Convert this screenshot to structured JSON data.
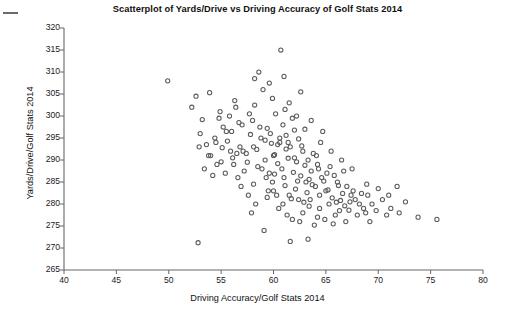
{
  "chart_data": {
    "type": "scatter",
    "title": "Scatterplot of Yards/Drive vs Driving Accuracy of Golf Stats 2014",
    "xlabel": "Driving Accuracy/Golf Stats 2014",
    "ylabel": "Yards/Drive/Golf Stats 2014",
    "xlim": [
      40,
      80
    ],
    "ylim": [
      265,
      320
    ],
    "xticks": [
      40,
      45,
      50,
      55,
      60,
      65,
      70,
      75,
      80
    ],
    "yticks": [
      265,
      270,
      275,
      280,
      285,
      290,
      295,
      300,
      305,
      310,
      315,
      320
    ],
    "grid": false,
    "legend": null,
    "marker": {
      "shape": "open-circle",
      "color": "#5c5c5c",
      "size_px": 4.2,
      "fill": "none"
    },
    "n_points": 191,
    "correlation_description": "negative",
    "series": [
      {
        "name": "PGA Tour players 2014",
        "points": [
          [
            49.9,
            308.0
          ],
          [
            52.6,
            304.5
          ],
          [
            53.9,
            305.3
          ],
          [
            54.9,
            301.0
          ],
          [
            55.8,
            300.0
          ],
          [
            53.2,
            299.2
          ],
          [
            56.4,
            302.0
          ],
          [
            57.0,
            298.0
          ],
          [
            55.2,
            297.5
          ],
          [
            56.0,
            296.5
          ],
          [
            54.4,
            295.0
          ],
          [
            55.6,
            294.3
          ],
          [
            53.6,
            293.5
          ],
          [
            56.8,
            293.0
          ],
          [
            54.0,
            291.0
          ],
          [
            55.0,
            289.6
          ],
          [
            56.2,
            289.0
          ],
          [
            57.4,
            291.5
          ],
          [
            52.8,
            271.2
          ],
          [
            57.8,
            295.8
          ],
          [
            58.2,
            302.5
          ],
          [
            58.6,
            310.0
          ],
          [
            59.0,
            306.0
          ],
          [
            58.0,
            299.0
          ],
          [
            59.4,
            297.2
          ],
          [
            58.8,
            295.0
          ],
          [
            59.8,
            293.8
          ],
          [
            58.4,
            292.4
          ],
          [
            60.0,
            291.0
          ],
          [
            59.2,
            290.0
          ],
          [
            60.4,
            289.2
          ],
          [
            58.9,
            288.0
          ],
          [
            59.6,
            287.0
          ],
          [
            60.7,
            315.0
          ],
          [
            61.0,
            309.0
          ],
          [
            61.5,
            303.0
          ],
          [
            60.2,
            300.5
          ],
          [
            61.8,
            299.5
          ],
          [
            60.9,
            298.0
          ],
          [
            62.0,
            296.8
          ],
          [
            61.2,
            295.6
          ],
          [
            62.4,
            294.8
          ],
          [
            60.6,
            294.0
          ],
          [
            61.6,
            293.0
          ],
          [
            62.8,
            292.0
          ],
          [
            60.1,
            291.2
          ],
          [
            61.4,
            290.4
          ],
          [
            62.2,
            289.6
          ],
          [
            63.0,
            288.8
          ],
          [
            60.8,
            288.0
          ],
          [
            61.9,
            287.2
          ],
          [
            62.6,
            286.4
          ],
          [
            63.4,
            285.6
          ],
          [
            59.9,
            285.0
          ],
          [
            61.1,
            284.2
          ],
          [
            62.1,
            283.4
          ],
          [
            63.2,
            282.6
          ],
          [
            60.3,
            282.0
          ],
          [
            61.7,
            281.2
          ],
          [
            62.9,
            280.4
          ],
          [
            63.8,
            291.5
          ],
          [
            64.2,
            289.0
          ],
          [
            63.6,
            287.5
          ],
          [
            64.6,
            286.0
          ],
          [
            63.1,
            285.0
          ],
          [
            64.0,
            284.0
          ],
          [
            65.0,
            283.0
          ],
          [
            64.4,
            282.0
          ],
          [
            63.5,
            281.0
          ],
          [
            65.4,
            288.5
          ],
          [
            65.8,
            286.5
          ],
          [
            64.8,
            285.2
          ],
          [
            66.2,
            284.2
          ],
          [
            65.2,
            283.2
          ],
          [
            66.6,
            282.4
          ],
          [
            65.6,
            281.4
          ],
          [
            66.0,
            280.4
          ],
          [
            67.0,
            284.0
          ],
          [
            67.4,
            282.0
          ],
          [
            66.4,
            280.8
          ],
          [
            67.8,
            281.0
          ],
          [
            66.8,
            279.6
          ],
          [
            68.2,
            280.0
          ],
          [
            67.2,
            278.6
          ],
          [
            68.6,
            279.0
          ],
          [
            69.0,
            282.0
          ],
          [
            69.4,
            280.0
          ],
          [
            68.8,
            278.0
          ],
          [
            70.0,
            283.5
          ],
          [
            70.4,
            281.0
          ],
          [
            71.2,
            279.0
          ],
          [
            71.8,
            284.0
          ],
          [
            72.6,
            280.5
          ],
          [
            73.8,
            277.0
          ],
          [
            75.6,
            276.5
          ],
          [
            57.2,
            287.5
          ],
          [
            58.1,
            284.5
          ],
          [
            59.5,
            283.0
          ],
          [
            60.5,
            279.0
          ],
          [
            61.3,
            277.5
          ],
          [
            62.5,
            276.0
          ],
          [
            63.9,
            275.2
          ],
          [
            64.9,
            276.5
          ],
          [
            65.9,
            277.5
          ],
          [
            66.9,
            276.0
          ],
          [
            57.6,
            282.0
          ],
          [
            58.3,
            280.0
          ],
          [
            56.6,
            286.0
          ],
          [
            55.4,
            287.0
          ],
          [
            54.6,
            289.0
          ],
          [
            53.4,
            288.0
          ],
          [
            56.9,
            284.0
          ],
          [
            57.9,
            278.0
          ],
          [
            59.1,
            274.0
          ],
          [
            61.6,
            271.5
          ],
          [
            63.3,
            272.0
          ],
          [
            55.9,
            292.0
          ],
          [
            54.2,
            286.5
          ],
          [
            52.2,
            302.0
          ],
          [
            53.0,
            296.0
          ],
          [
            54.8,
            299.5
          ],
          [
            56.5,
            291.5
          ],
          [
            57.5,
            289.5
          ],
          [
            58.5,
            288.5
          ],
          [
            59.3,
            286.0
          ],
          [
            60.1,
            286.8
          ],
          [
            61.0,
            286.0
          ],
          [
            62.3,
            285.2
          ],
          [
            63.7,
            284.4
          ],
          [
            64.3,
            288.0
          ],
          [
            65.1,
            287.0
          ],
          [
            66.1,
            285.0
          ],
          [
            67.6,
            283.0
          ],
          [
            68.4,
            282.4
          ],
          [
            69.8,
            278.5
          ],
          [
            58.7,
            297.5
          ],
          [
            59.7,
            296.0
          ],
          [
            60.6,
            295.0
          ],
          [
            61.4,
            294.0
          ],
          [
            62.7,
            293.2
          ],
          [
            63.3,
            290.0
          ],
          [
            64.1,
            291.0
          ],
          [
            62.0,
            290.5
          ],
          [
            61.2,
            292.5
          ],
          [
            60.4,
            293.5
          ],
          [
            59.2,
            294.5
          ],
          [
            58.1,
            293.0
          ],
          [
            57.1,
            292.0
          ],
          [
            56.1,
            290.5
          ],
          [
            55.1,
            292.8
          ],
          [
            57.7,
            300.5
          ],
          [
            56.3,
            303.5
          ],
          [
            59.9,
            304.0
          ],
          [
            61.1,
            301.5
          ],
          [
            62.2,
            300.0
          ],
          [
            63.0,
            297.0
          ],
          [
            64.5,
            294.0
          ],
          [
            65.5,
            292.0
          ],
          [
            66.5,
            290.0
          ],
          [
            67.5,
            288.0
          ],
          [
            58.2,
            308.5
          ],
          [
            59.6,
            307.5
          ],
          [
            62.6,
            305.5
          ],
          [
            63.6,
            299.0
          ],
          [
            64.7,
            296.5
          ],
          [
            60.0,
            283.0
          ],
          [
            61.5,
            282.0
          ],
          [
            62.4,
            281.0
          ],
          [
            63.4,
            279.5
          ],
          [
            64.4,
            279.0
          ],
          [
            65.3,
            280.0
          ],
          [
            66.3,
            278.5
          ],
          [
            67.3,
            280.5
          ],
          [
            68.0,
            277.5
          ],
          [
            69.2,
            276.0
          ],
          [
            54.5,
            294.0
          ],
          [
            55.5,
            296.5
          ],
          [
            56.7,
            298.5
          ],
          [
            53.8,
            291.0
          ],
          [
            52.9,
            293.0
          ],
          [
            59.4,
            281.5
          ],
          [
            60.9,
            280.0
          ],
          [
            62.8,
            278.0
          ],
          [
            61.8,
            276.5
          ],
          [
            64.2,
            277.0
          ],
          [
            65.7,
            275.5
          ],
          [
            70.8,
            277.5
          ],
          [
            71.0,
            282.0
          ],
          [
            72.0,
            278.0
          ],
          [
            68.9,
            284.5
          ],
          [
            66.7,
            287.5
          ]
        ]
      }
    ]
  },
  "axis": {
    "x_tick_labels": [
      "40",
      "45",
      "50",
      "55",
      "60",
      "65",
      "70",
      "75",
      "80"
    ],
    "y_tick_labels": [
      "265",
      "270",
      "275",
      "280",
      "285",
      "290",
      "295",
      "300",
      "305",
      "310",
      "315",
      "320"
    ]
  },
  "decor": {
    "corner_mark": "dash-mark"
  }
}
